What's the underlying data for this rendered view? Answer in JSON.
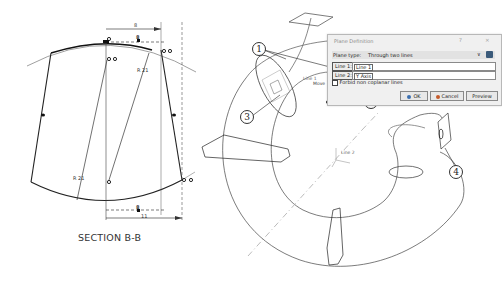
{
  "section_drawing": {
    "caption": "SECTION B-B",
    "dimensions": {
      "top_width": "8",
      "top_small": "8",
      "radius_upper": "R 21",
      "radius_lower": "R 21",
      "bottom_small": "8",
      "bottom_width": "11"
    }
  },
  "model_view": {
    "labels": {
      "line1": "Line 1",
      "line2": "Line 2",
      "move": "Move"
    },
    "callouts": [
      "1",
      "2",
      "3",
      "4"
    ]
  },
  "dialog": {
    "title": "Plane Definition",
    "help_glyph": "?",
    "close_glyph": "×",
    "plane_type_label": "Plane type:",
    "plane_type_value": "Through two lines",
    "line1_label": "Line 1:",
    "line1_value": "Line 1",
    "line2_label": "Line 2:",
    "line2_value": "Y Axis",
    "checkbox_label": "Forbid non coplanar lines",
    "buttons": {
      "ok": "OK",
      "cancel": "Cancel",
      "preview": "Preview"
    }
  }
}
